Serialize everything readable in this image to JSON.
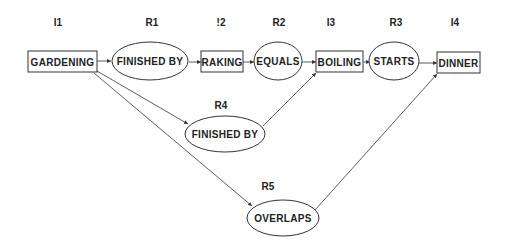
{
  "diagram": {
    "type": "interval-relation-network",
    "header_labels": {
      "I1": "I1",
      "R1": "R1",
      "I2": "!2",
      "R2": "R2",
      "I3": "I3",
      "R3": "R3",
      "I4": "I4",
      "R4": "R4",
      "R5": "R5"
    },
    "intervals": [
      {
        "id": "I1",
        "label": "GARDENING"
      },
      {
        "id": "I2",
        "label": "RAKING"
      },
      {
        "id": "I3",
        "label": "BOILING"
      },
      {
        "id": "I4",
        "label": "DINNER"
      }
    ],
    "relations": [
      {
        "id": "R1",
        "label": "FINISHED BY",
        "from": "I1",
        "to": "I2"
      },
      {
        "id": "R2",
        "label": "EQUALS",
        "from": "I2",
        "to": "I3"
      },
      {
        "id": "R3",
        "label": "STARTS",
        "from": "I3",
        "to": "I4"
      },
      {
        "id": "R4",
        "label": "FINISHED BY",
        "from": "I1",
        "to": "I3"
      },
      {
        "id": "R5",
        "label": "OVERLAPS",
        "from": "I1",
        "to": "I4"
      }
    ],
    "colors": {
      "stroke": "#333333",
      "text": "#222222",
      "background": "#ffffff"
    }
  }
}
